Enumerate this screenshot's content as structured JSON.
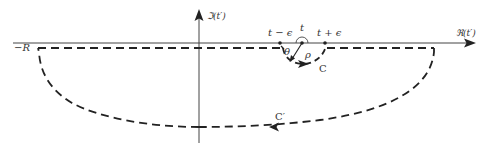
{
  "diagram": {
    "type": "contour-integral-complex-plane",
    "colors": {
      "ink": "#222222",
      "axis": "#444444",
      "background": "#ffffff"
    },
    "axes": {
      "imaginary_label": "ℑ(t′)",
      "real_label": "ℜ(t′)"
    },
    "points": {
      "left_limit": "−R",
      "t_minus": "t − ϵ",
      "t": "t",
      "t_plus": "t + ϵ"
    },
    "symbols": {
      "angle": "θ",
      "radius": "ρ"
    },
    "contours": {
      "small": "C",
      "large": "C′"
    }
  }
}
